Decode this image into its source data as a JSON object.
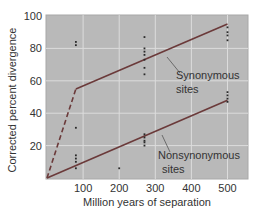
{
  "chart_data": {
    "type": "scatter",
    "title": "",
    "xlabel": "Million years of separation",
    "ylabel": "Corrected percent divergence",
    "xlim": [
      0,
      560
    ],
    "ylim": [
      0,
      100
    ],
    "x_ticks": [
      100,
      200,
      300,
      400,
      500
    ],
    "y_ticks": [
      20,
      40,
      60,
      80,
      100
    ],
    "grid": true,
    "series": [
      {
        "name": "Synonymous sites",
        "points": [
          {
            "x": 80,
            "y": 82
          },
          {
            "x": 80,
            "y": 84
          },
          {
            "x": 270,
            "y": 87
          },
          {
            "x": 270,
            "y": 80
          },
          {
            "x": 270,
            "y": 78
          },
          {
            "x": 270,
            "y": 76
          },
          {
            "x": 270,
            "y": 73
          },
          {
            "x": 270,
            "y": 68
          },
          {
            "x": 270,
            "y": 64
          },
          {
            "x": 500,
            "y": 93
          },
          {
            "x": 500,
            "y": 90
          },
          {
            "x": 500,
            "y": 88
          },
          {
            "x": 500,
            "y": 85
          }
        ],
        "fit_line": [
          {
            "x": 80,
            "y": 55
          },
          {
            "x": 500,
            "y": 95
          }
        ]
      },
      {
        "name": "Nonsynonymous sites",
        "points": [
          {
            "x": 80,
            "y": 31
          },
          {
            "x": 80,
            "y": 14
          },
          {
            "x": 80,
            "y": 12
          },
          {
            "x": 80,
            "y": 10
          },
          {
            "x": 80,
            "y": 6
          },
          {
            "x": 200,
            "y": 6
          },
          {
            "x": 270,
            "y": 27
          },
          {
            "x": 270,
            "y": 25
          },
          {
            "x": 270,
            "y": 23
          },
          {
            "x": 270,
            "y": 22
          },
          {
            "x": 270,
            "y": 20
          },
          {
            "x": 500,
            "y": 53
          },
          {
            "x": 500,
            "y": 51
          },
          {
            "x": 500,
            "y": 49
          },
          {
            "x": 500,
            "y": 47
          }
        ],
        "fit_line": [
          {
            "x": 0,
            "y": 0
          },
          {
            "x": 500,
            "y": 48
          }
        ]
      },
      {
        "name": "Extrapolated synonymous (dashed)",
        "style": "dashed",
        "fit_line": [
          {
            "x": 0,
            "y": 0
          },
          {
            "x": 80,
            "y": 55
          }
        ]
      }
    ],
    "annotations": [
      {
        "text": "Synonymous sites",
        "lines": [
          "Synonymous",
          "sites"
        ]
      },
      {
        "text": "Nonsynonymous sites",
        "lines": [
          "Nonsynonymous",
          "sites"
        ]
      }
    ]
  },
  "labels": {
    "xlabel": "Million years of separation",
    "ylabel": "Corrected percent divergence",
    "x_ticks": [
      "100",
      "200",
      "300",
      "400",
      "500"
    ],
    "y_ticks": [
      "20",
      "40",
      "60",
      "80",
      "100"
    ],
    "syn_line1": "Synonymous",
    "syn_line2": "sites",
    "nonsyn_line1": "Nonsynonymous",
    "nonsyn_line2": "sites"
  },
  "colors": {
    "plot_bg": "#b9b9b9",
    "grid": "#dcdcdc",
    "line": "#6b3a3a",
    "points": "#2a2a2a",
    "text": "#333333"
  }
}
